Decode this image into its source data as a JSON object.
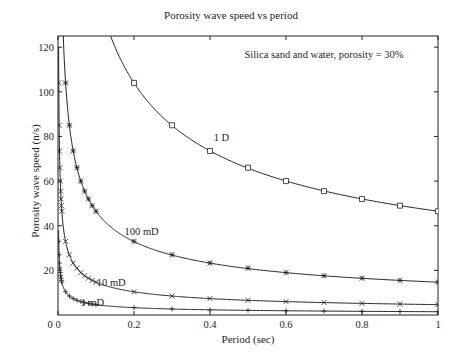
{
  "chart_data": {
    "type": "line",
    "title": "Porosity wave speed vs period",
    "xlabel": "Period (sec)",
    "ylabel": "Porosity wave speed (n/s)",
    "xlim": [
      0,
      1
    ],
    "ylim": [
      0,
      125
    ],
    "x_ticks": [
      0,
      0.2,
      0.4,
      0.6,
      0.8,
      1
    ],
    "x_tick_labels": [
      "0",
      "0.2",
      "0.4",
      "0.6",
      "0.8",
      "1"
    ],
    "y_ticks": [
      20,
      40,
      60,
      80,
      100,
      120
    ],
    "y_tick_labels": [
      "20",
      "40",
      "60",
      "80",
      "100",
      "120"
    ],
    "grid": false,
    "legend": null,
    "annotations": [
      {
        "text": "Silica sand and water, porosity = 30%",
        "x": 0.7,
        "y": 115
      },
      {
        "text": "1 D",
        "x": 0.43,
        "y": 78
      },
      {
        "text": "100 mD",
        "x": 0.22,
        "y": 36
      },
      {
        "text": "10 mD",
        "x": 0.14,
        "y": 13
      },
      {
        "text": "1 mD",
        "x": 0.09,
        "y": 4
      }
    ],
    "series": [
      {
        "name": "1 D",
        "marker": "square",
        "coefficient": 46.5,
        "x": [
          0.2,
          0.3,
          0.4,
          0.5,
          0.6,
          0.7,
          0.8,
          0.9,
          1.0
        ],
        "values": [
          104,
          85,
          73.5,
          66,
          60,
          55.5,
          52,
          49,
          46.5
        ]
      },
      {
        "name": "100 mD",
        "marker": "asterisk",
        "coefficient": 14.7,
        "x": [
          0.02,
          0.03,
          0.04,
          0.05,
          0.06,
          0.07,
          0.08,
          0.09,
          0.1,
          0.2,
          0.3,
          0.4,
          0.5,
          0.6,
          0.7,
          0.8,
          0.9,
          1.0
        ],
        "values": [
          104,
          85,
          73.5,
          66,
          60,
          55.5,
          52,
          49,
          46.5,
          33,
          27,
          23.3,
          21,
          19,
          17.6,
          16.5,
          15.5,
          14.7
        ]
      },
      {
        "name": "10 mD",
        "marker": "x",
        "coefficient": 4.65,
        "x": [
          0.002,
          0.003,
          0.004,
          0.005,
          0.006,
          0.007,
          0.008,
          0.009,
          0.01,
          0.02,
          0.03,
          0.04,
          0.05,
          0.06,
          0.07,
          0.08,
          0.09,
          0.1,
          0.2,
          0.3,
          0.4,
          0.5,
          0.6,
          0.7,
          0.8,
          0.9,
          1.0
        ],
        "values": [
          104,
          85,
          73.5,
          66,
          60,
          55.5,
          52,
          49,
          46.5,
          33,
          27,
          23.3,
          21,
          19,
          17.6,
          16.5,
          15.5,
          14.7,
          10.4,
          8.5,
          7.4,
          6.6,
          6.0,
          5.6,
          5.2,
          4.9,
          4.65
        ]
      },
      {
        "name": "1 mD",
        "marker": "plus",
        "coefficient": 1.47,
        "x": [
          0.002,
          0.003,
          0.004,
          0.005,
          0.006,
          0.007,
          0.008,
          0.009,
          0.01,
          0.02,
          0.03,
          0.04,
          0.05,
          0.06,
          0.07,
          0.08,
          0.09,
          0.1,
          0.2,
          0.3,
          0.4,
          0.5,
          0.6,
          0.7,
          0.8,
          0.9,
          1.0
        ],
        "values": [
          33,
          27,
          23.3,
          21,
          19,
          17.6,
          16.5,
          15.5,
          14.7,
          10.4,
          8.5,
          7.4,
          6.6,
          6.0,
          5.6,
          5.2,
          4.9,
          4.65,
          3.3,
          2.7,
          2.3,
          2.1,
          1.9,
          1.76,
          1.65,
          1.55,
          1.47
        ]
      }
    ]
  }
}
